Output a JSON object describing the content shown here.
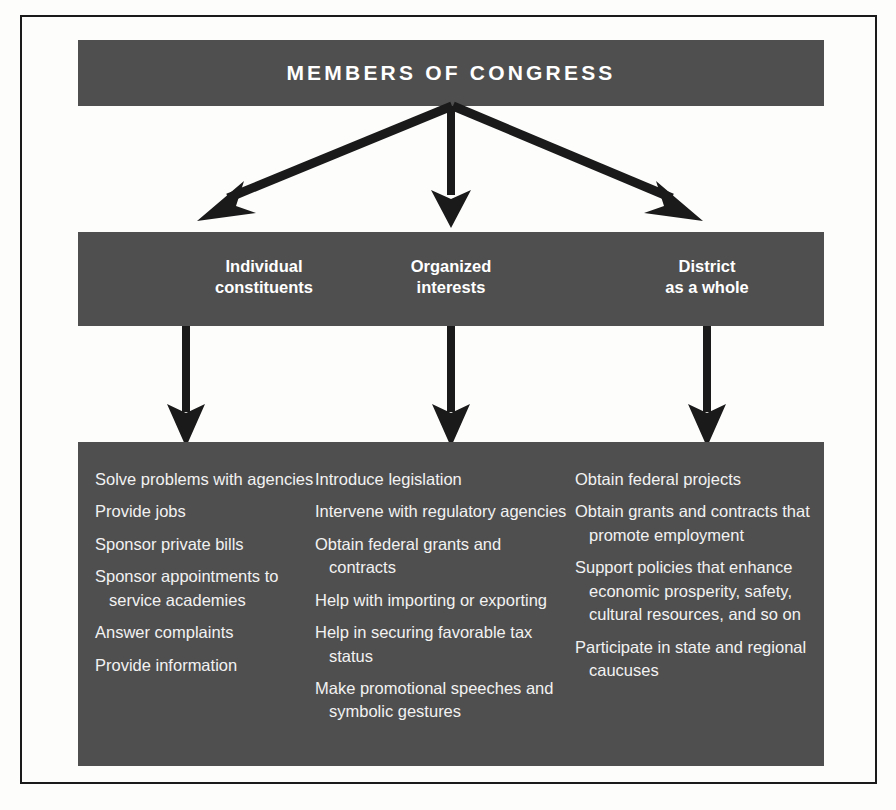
{
  "figure": {
    "title": "MEMBERS OF CONGRESS",
    "colors": {
      "band_gray": "#4f4f4f",
      "band_text": "#ffffff",
      "list_text": "#f2f2f2",
      "arrow": "#1a1a1a",
      "frame": "#1a1a1a",
      "page_background": "#fdfdfc"
    }
  },
  "top_band": {
    "label": "MEMBERS OF CONGRESS"
  },
  "middle_band": {
    "categories": [
      {
        "line1": "Individual",
        "line2": "constituents"
      },
      {
        "line1": "Organized",
        "line2": "interests"
      },
      {
        "line1": "District",
        "line2": "as a whole"
      }
    ]
  },
  "bottom_band": {
    "columns": [
      {
        "category": "Individual constituents",
        "items": [
          "Solve problems with agencies",
          "Provide jobs",
          "Sponsor private bills",
          "Sponsor appointments to service academies",
          "Answer complaints",
          "Provide information"
        ]
      },
      {
        "category": "Organized interests",
        "items": [
          "Introduce legislation",
          "Intervene with regulatory agencies",
          "Obtain federal grants and contracts",
          "Help with importing or exporting",
          "Help in securing favorable tax status",
          "Make promotional speeches and symbolic gestures"
        ]
      },
      {
        "category": "District as a whole",
        "items": [
          "Obtain federal projects",
          "Obtain grants and contracts that promote employment",
          "Support policies that enhance economic prosperity, safety, cultural resources, and so on",
          "Participate in state and regional caucuses"
        ]
      }
    ]
  },
  "connectors": {
    "fan_arrows": [
      {
        "name": "arrow-to-individual-constituents",
        "from": "members-of-congress",
        "to": "individual-constituents"
      },
      {
        "name": "arrow-to-organized-interests",
        "from": "members-of-congress",
        "to": "organized-interests"
      },
      {
        "name": "arrow-to-district-as-a-whole",
        "from": "members-of-congress",
        "to": "district-as-a-whole"
      }
    ],
    "down_arrows": [
      {
        "name": "arrow-individual-constituents-to-services",
        "from": "individual-constituents",
        "to": "constituent-services-list"
      },
      {
        "name": "arrow-organized-interests-to-services",
        "from": "organized-interests",
        "to": "organized-interest-services-list"
      },
      {
        "name": "arrow-district-to-services",
        "from": "district-as-a-whole",
        "to": "district-services-list"
      }
    ]
  }
}
